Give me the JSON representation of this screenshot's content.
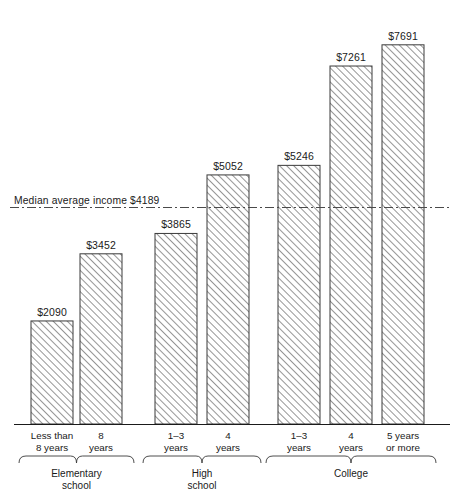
{
  "chart_data": {
    "type": "bar",
    "title": "",
    "xlabel": "",
    "ylabel": "",
    "ylim": [
      0,
      8600
    ],
    "grid": false,
    "legend": null,
    "orientation": "vertical",
    "bar_fill": "hatched-diagonal",
    "categories": [
      "Less than 8 years",
      "8 years",
      "1-3 years",
      "4 years",
      "1-3 years",
      "4 years",
      "5 years or more"
    ],
    "values": [
      2090,
      3452,
      3865,
      5052,
      5246,
      7261,
      7691
    ],
    "value_labels": [
      "$2090",
      "$3452",
      "$3865",
      "$5052",
      "$5246",
      "$7261",
      "$7691"
    ],
    "groups": [
      {
        "label": "Elementary school",
        "line1": "Elementary",
        "line2": "school",
        "members": [
          0,
          1
        ]
      },
      {
        "label": "High school",
        "line1": "High",
        "line2": "school",
        "members": [
          2,
          3
        ]
      },
      {
        "label": "College",
        "line1": "College",
        "line2": "",
        "members": [
          4,
          5,
          6
        ]
      }
    ],
    "reference_line": {
      "label": "Median average income $4189",
      "value": 4189,
      "style": "dash-dot"
    },
    "tick_labels": [
      {
        "line1": "Less than",
        "line2": "8 years"
      },
      {
        "line1": "8",
        "line2": "years"
      },
      {
        "line1": "1–3",
        "line2": "years"
      },
      {
        "line1": "4",
        "line2": "years"
      },
      {
        "line1": "1–3",
        "line2": "years"
      },
      {
        "line1": "4",
        "line2": "years"
      },
      {
        "line1": "5 years",
        "line2": "or more"
      }
    ]
  },
  "colors": {
    "ink": "#1a1a1a",
    "hatch": "#6e6e6e",
    "bar_border": "#3a3a3a",
    "axis": "#1a1a1a",
    "background": "#ffffff"
  }
}
